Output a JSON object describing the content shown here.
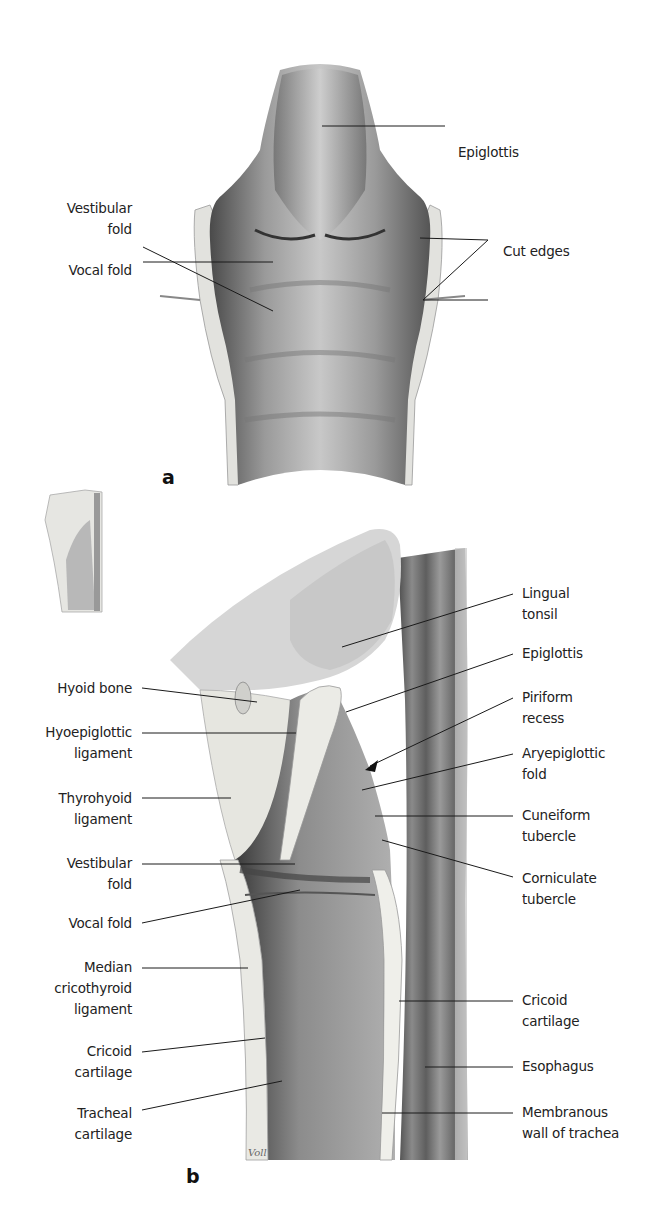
{
  "figure": {
    "panels": [
      {
        "id": "a",
        "letter": "a",
        "view": "posterior view, opened larynx",
        "labels": [
          {
            "key": "epiglottis",
            "lines": [
              "Epiglottis"
            ]
          },
          {
            "key": "vestibular_fold",
            "lines": [
              "Vestibular",
              "fold"
            ]
          },
          {
            "key": "vocal_fold",
            "lines": [
              "Vocal fold"
            ]
          },
          {
            "key": "cut_edges",
            "lines": [
              "Cut edges"
            ]
          }
        ]
      },
      {
        "id": "b",
        "letter": "b",
        "view": "midsagittal section",
        "labels_left": [
          {
            "key": "hyoid_bone",
            "lines": [
              "Hyoid bone"
            ]
          },
          {
            "key": "hyoepiglottic_ligament",
            "lines": [
              "Hyoepiglottic",
              "ligament"
            ]
          },
          {
            "key": "thyrohyoid_ligament",
            "lines": [
              "Thyrohyoid",
              "ligament"
            ]
          },
          {
            "key": "vestibular_fold",
            "lines": [
              "Vestibular",
              "fold"
            ]
          },
          {
            "key": "vocal_fold",
            "lines": [
              "Vocal fold"
            ]
          },
          {
            "key": "median_cricothyroid_ligament",
            "lines": [
              "Median",
              "cricothyroid",
              "ligament"
            ]
          },
          {
            "key": "cricoid_cartilage",
            "lines": [
              "Cricoid",
              "cartilage"
            ]
          },
          {
            "key": "tracheal_cartilage",
            "lines": [
              "Tracheal",
              "cartilage"
            ]
          }
        ],
        "labels_right": [
          {
            "key": "lingual_tonsil",
            "lines": [
              "Lingual",
              "tonsil"
            ]
          },
          {
            "key": "epiglottis",
            "lines": [
              "Epiglottis"
            ]
          },
          {
            "key": "piriform_recess",
            "lines": [
              "Piriform",
              "recess"
            ]
          },
          {
            "key": "aryepiglottic_fold",
            "lines": [
              "Aryepiglottic",
              "fold"
            ]
          },
          {
            "key": "cuneiform_tubercle",
            "lines": [
              "Cuneiform",
              "tubercle"
            ]
          },
          {
            "key": "corniculate_tubercle",
            "lines": [
              "Corniculate",
              "tubercle"
            ]
          },
          {
            "key": "cricoid_cartilage",
            "lines": [
              "Cricoid",
              "cartilage"
            ]
          },
          {
            "key": "esophagus",
            "lines": [
              "Esophagus"
            ]
          },
          {
            "key": "membranous_wall_of_trachea",
            "lines": [
              "Membranous",
              "wall of trachea"
            ]
          }
        ],
        "signature": "Voll"
      }
    ],
    "colors": {
      "background": "#ffffff",
      "text": "#222222",
      "leader_line": "#1a1a1a",
      "mucosa_light": "#d9d9d9",
      "mucosa_mid": "#a6a6a6",
      "mucosa_dark": "#5a5a5a",
      "cartilage": "#e6e6e2",
      "esophagus": "#8c8c8c"
    }
  }
}
